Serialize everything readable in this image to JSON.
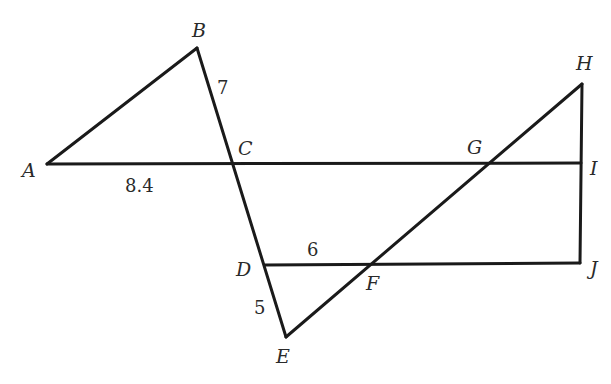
{
  "diagram": {
    "background": "#ffffff",
    "stroke_color": "#1a1a1a",
    "points": {
      "A": {
        "x": 47,
        "y": 164,
        "label": "A",
        "lx": 22,
        "ly": 177
      },
      "B": {
        "x": 197,
        "y": 48,
        "label": "B",
        "lx": 192,
        "ly": 37
      },
      "C": {
        "x": 233,
        "y": 164,
        "label": "C",
        "lx": 238,
        "ly": 155
      },
      "D": {
        "x": 265,
        "y": 265,
        "label": "D",
        "lx": 236,
        "ly": 276
      },
      "E": {
        "x": 286,
        "y": 337,
        "label": "E",
        "lx": 276,
        "ly": 363
      },
      "F": {
        "x": 371,
        "y": 264,
        "label": "F",
        "lx": 366,
        "ly": 290
      },
      "G": {
        "x": 488,
        "y": 163,
        "label": "G",
        "lx": 467,
        "ly": 154
      },
      "H": {
        "x": 582,
        "y": 84,
        "label": "H",
        "lx": 576,
        "ly": 70
      },
      "I": {
        "x": 581,
        "y": 163,
        "label": "I",
        "lx": 590,
        "ly": 175
      },
      "J": {
        "x": 580,
        "y": 263,
        "label": "J",
        "lx": 590,
        "ly": 275
      }
    },
    "segments": [
      {
        "from": "A",
        "to": "B"
      },
      {
        "from": "B",
        "to": "E"
      },
      {
        "from": "A",
        "to": "I"
      },
      {
        "from": "D",
        "to": "J"
      },
      {
        "from": "E",
        "to": "H"
      },
      {
        "from": "H",
        "to": "J"
      }
    ],
    "lengths": [
      {
        "segment": "BC",
        "value": "7",
        "x": 217,
        "y": 94
      },
      {
        "segment": "AC",
        "value": "8.4",
        "x": 125,
        "y": 192
      },
      {
        "segment": "DF",
        "value": "6",
        "x": 307,
        "y": 256
      },
      {
        "segment": "DE",
        "value": "5",
        "x": 254,
        "y": 314
      }
    ]
  }
}
